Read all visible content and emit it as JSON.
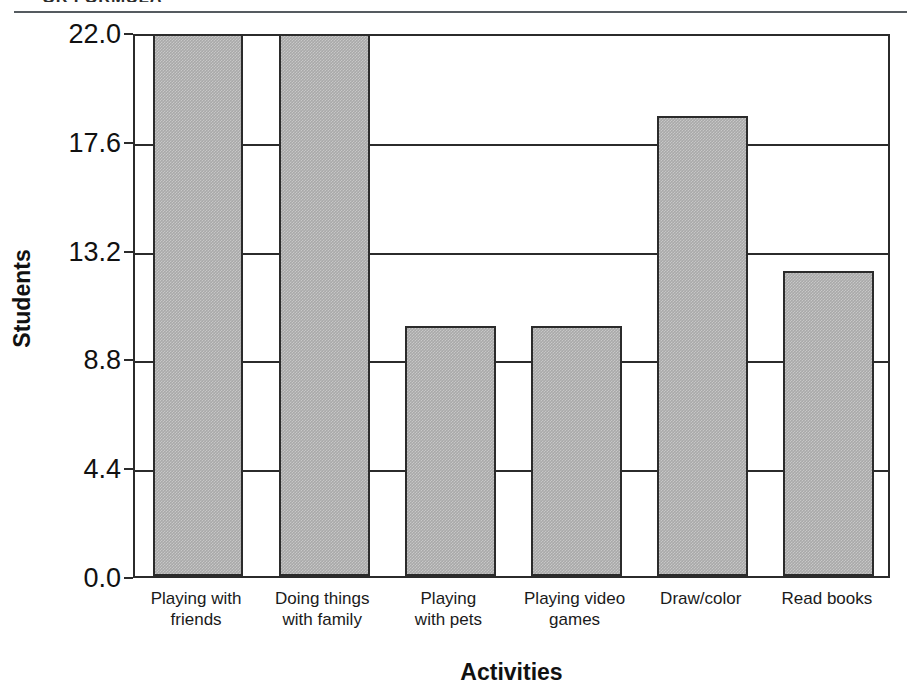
{
  "figure": {
    "clipped_title": "OR  FORMULA",
    "y_axis_title": "Students",
    "x_axis_title": "Activities"
  },
  "chart_data": {
    "type": "bar",
    "title": "",
    "xlabel": "Activities",
    "ylabel": "Students",
    "categories": [
      "Playing with friends",
      "Doing things with family",
      "Playing with pets",
      "Playing video games",
      "Draw/color",
      "Read books"
    ],
    "values": [
      22.0,
      22.0,
      10.0,
      10.0,
      18.5,
      12.2
    ],
    "ylim": [
      0.0,
      22.0
    ],
    "yticks": [
      0.0,
      4.4,
      8.8,
      13.2,
      17.6,
      22.0
    ],
    "ytick_labels": [
      "0.0",
      "4.4",
      "8.8",
      "13.2",
      "17.6",
      "22.0"
    ],
    "grid": true,
    "legend": false,
    "bar_color": "#a9a9a9",
    "bar_edge_color": "#2b2b2b"
  },
  "category_lines": [
    [
      "Playing with",
      "friends"
    ],
    [
      "Doing things",
      "with family"
    ],
    [
      "Playing",
      "with pets"
    ],
    [
      "Playing video",
      "games"
    ],
    [
      "Draw/color",
      ""
    ],
    [
      "Read books",
      ""
    ]
  ]
}
